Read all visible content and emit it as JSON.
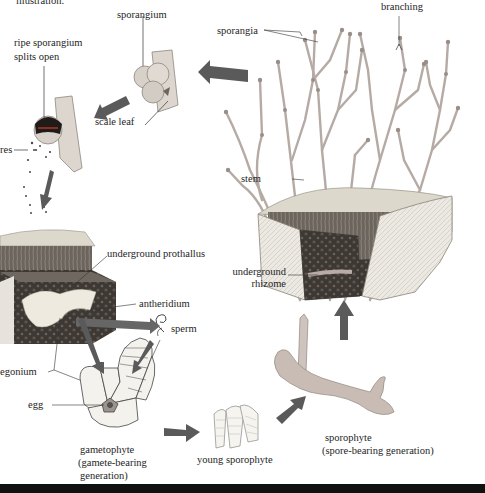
{
  "figure": {
    "topic": "Life cycle of a whisk fern (alternation of generations)",
    "caption_fragment": "illustration."
  },
  "labels": {
    "caption": "illustration.",
    "sporangium": "sporangium",
    "ripe_sporangium_1": "ripe sporangium",
    "ripe_sporangium_2": "splits open",
    "scale_leaf": "scale leaf",
    "spores": "res",
    "sporangia": "sporangia",
    "branching": "branching",
    "stem": "stem",
    "underground_rhizome_1": "underground",
    "underground_rhizome_2": "rhizome",
    "underground_prothallus": "underground prothallus",
    "antheridium": "antheridium",
    "sperm": "sperm",
    "archegonium": "egonium",
    "egg": "egg",
    "gametophyte_1": "gametophyte",
    "gametophyte_2": "(gamete-bearing",
    "gametophyte_3": "generation)",
    "young_sporophyte": "young sporophyte",
    "sporophyte_1": "sporophyte",
    "sporophyte_2": "(spore-bearing generation)"
  },
  "colors": {
    "arrow": "#5a5a5a",
    "stem": "#b9aca6",
    "soil_dark": "#3b3632",
    "soil_light": "#d8d4c8",
    "block_side": "#e6e3dc",
    "prothallus": "#eeeae0",
    "sporangium": "#d9d2cc",
    "leader": "#333333"
  },
  "arrows": [
    {
      "from": "adult-sporophyte",
      "to": "sporangium",
      "direction": "left"
    },
    {
      "from": "sporangium",
      "to": "ripe-sporangium",
      "direction": "down-left"
    },
    {
      "from": "spores",
      "to": "prothallus",
      "direction": "down"
    },
    {
      "from": "antheridium",
      "to": "sperm",
      "direction": "right"
    },
    {
      "from": "prothallus",
      "to": "gametophyte",
      "direction": "down-right"
    },
    {
      "from": "sperm",
      "to": "gametophyte",
      "direction": "down-left"
    },
    {
      "from": "gametophyte",
      "to": "young-sporophyte",
      "direction": "right"
    },
    {
      "from": "young-sporophyte",
      "to": "sporophyte",
      "direction": "up-right"
    },
    {
      "from": "sporophyte",
      "to": "adult-sporophyte",
      "direction": "up"
    }
  ]
}
